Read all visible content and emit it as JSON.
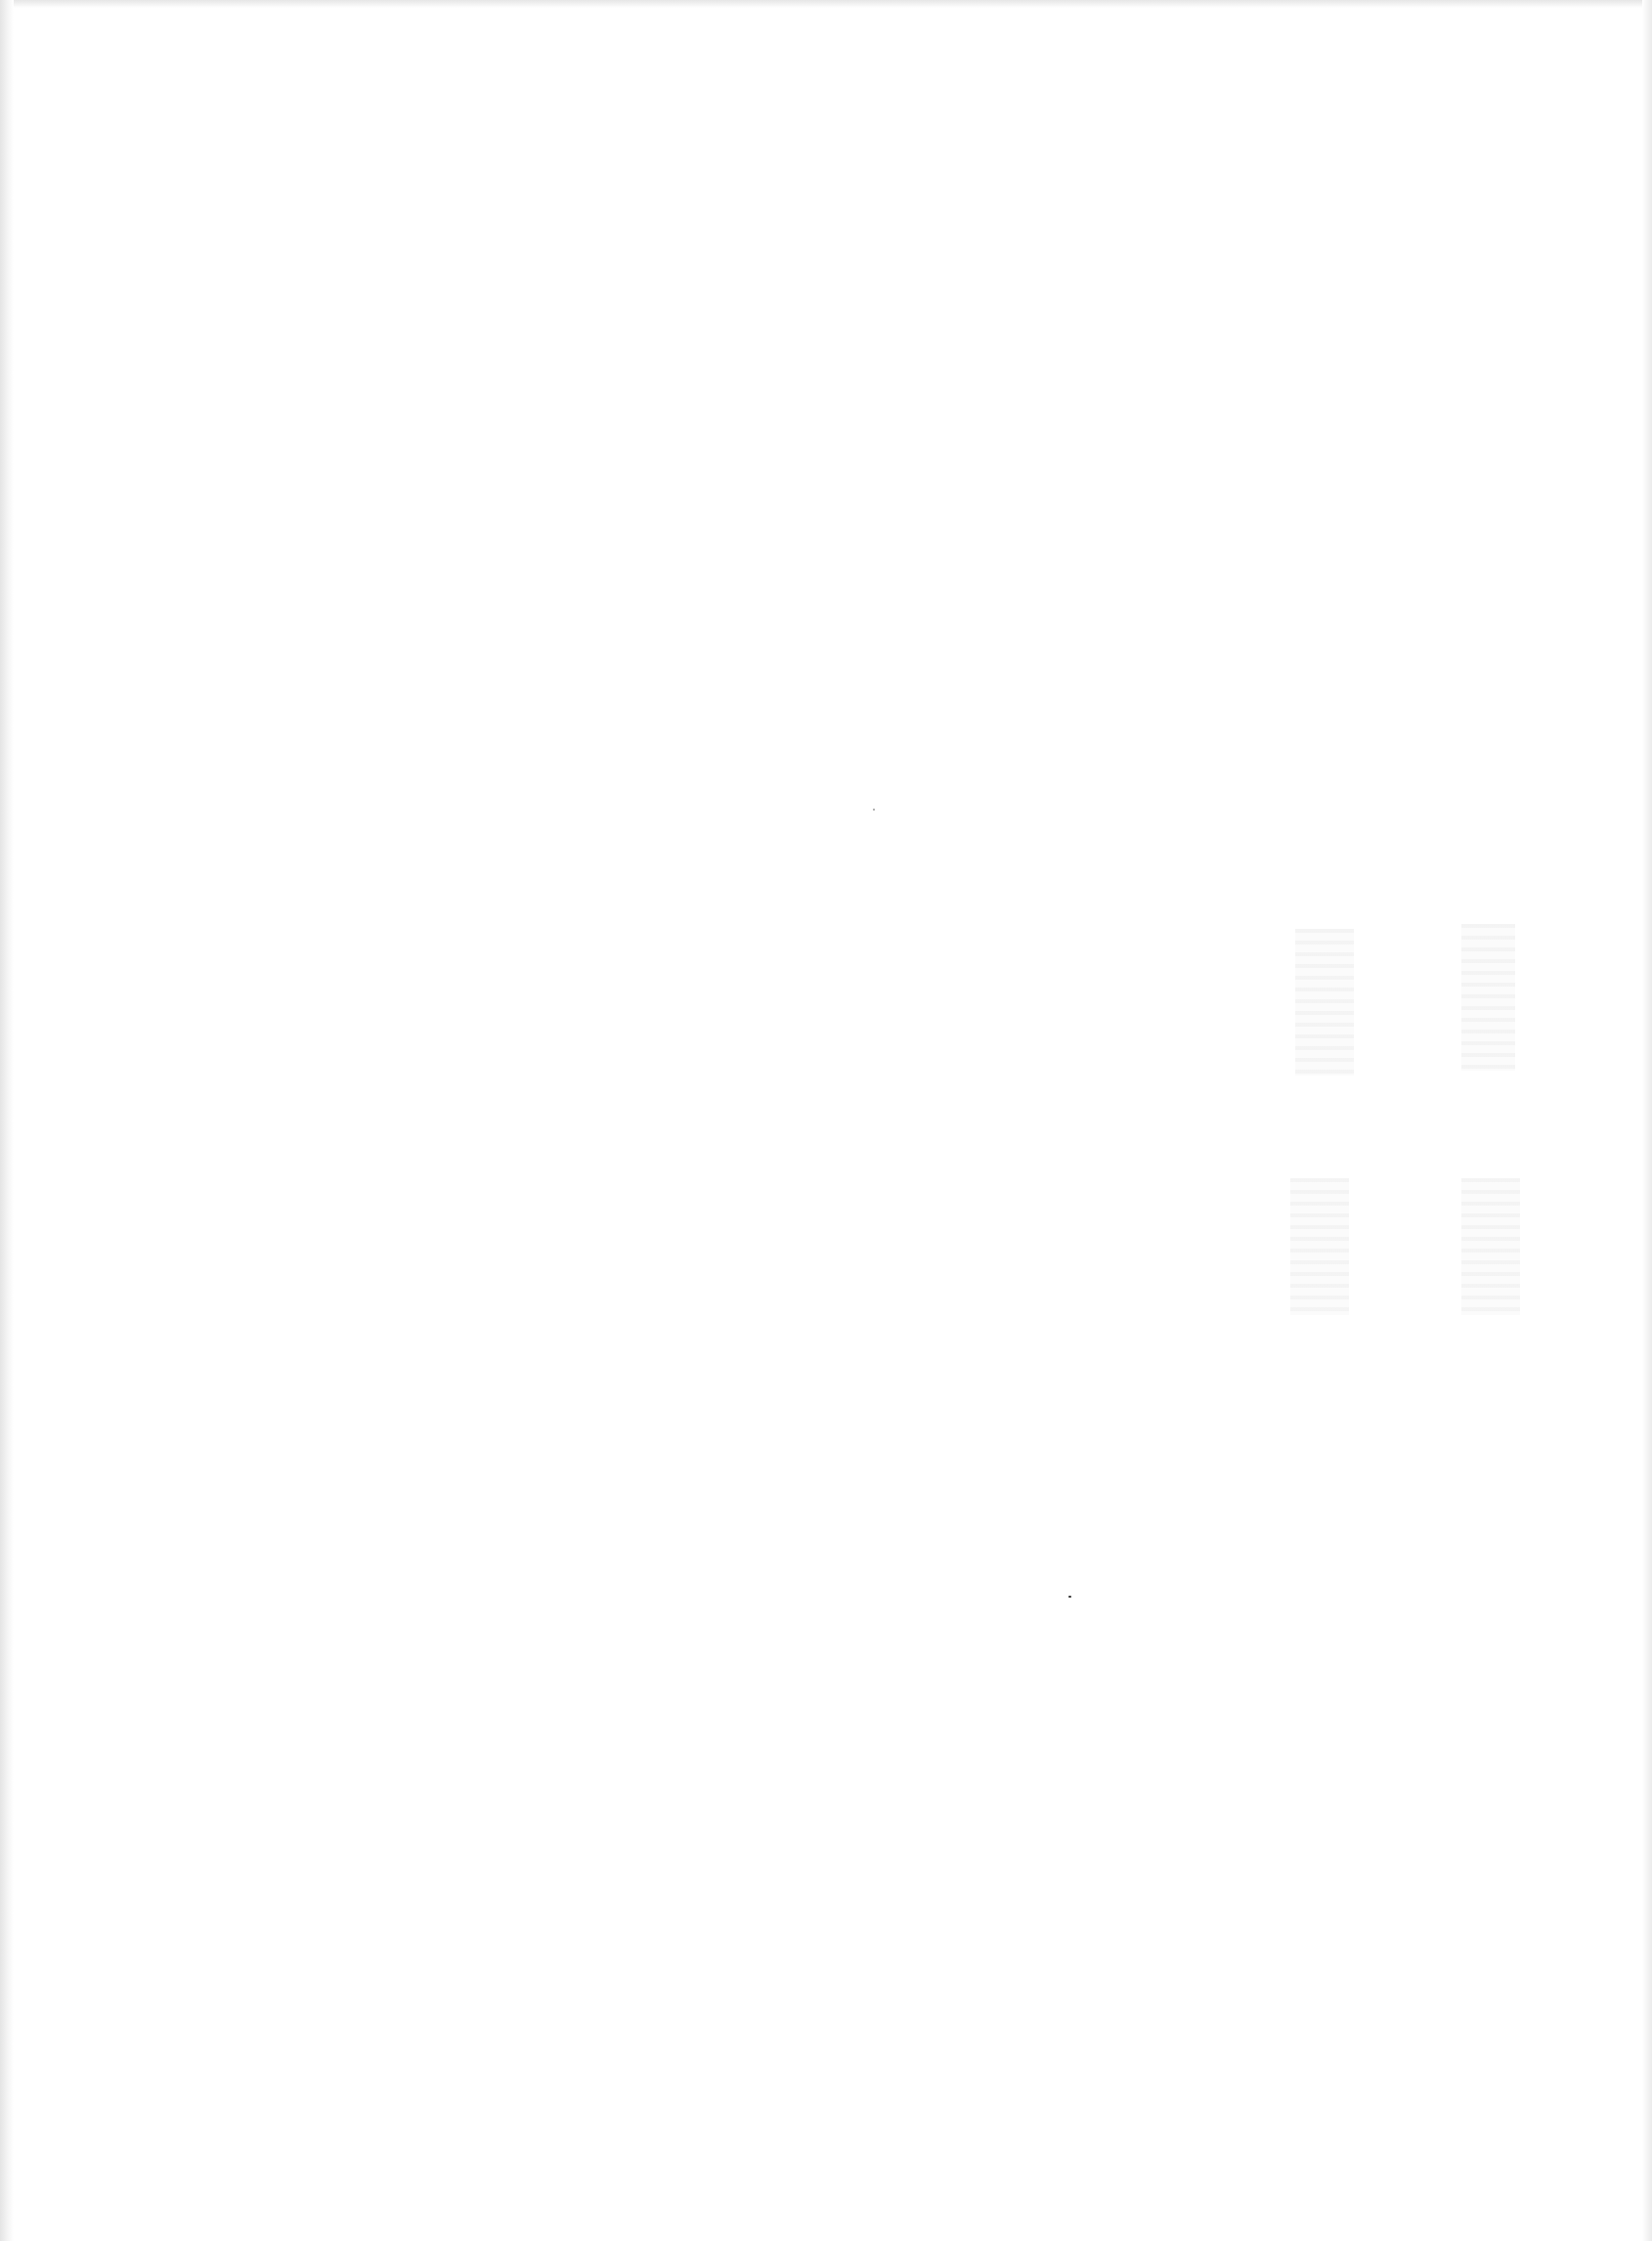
{
  "page": {
    "type": "blank scanned page",
    "text": ""
  }
}
